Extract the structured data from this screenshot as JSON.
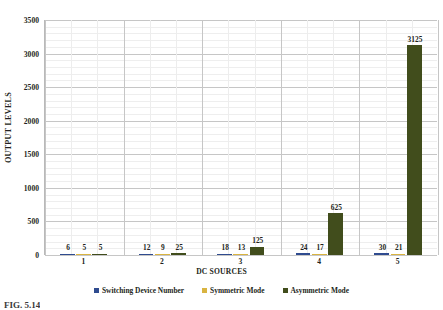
{
  "chart_data": {
    "type": "bar",
    "title": "",
    "xlabel": "DC SOURCES",
    "ylabel": "OUTPUT LEVELS",
    "categories": [
      "1",
      "2",
      "3",
      "4",
      "5"
    ],
    "ylim": [
      0,
      3500
    ],
    "ytick_step": 500,
    "yticks": [
      "0",
      "500",
      "1000",
      "1500",
      "2000",
      "2500",
      "3000",
      "3500"
    ],
    "grid": true,
    "legend_position": "bottom",
    "series": [
      {
        "name": "Switching Device Number",
        "color": "#2F4B8F",
        "values": [
          6,
          12,
          18,
          24,
          30
        ]
      },
      {
        "name": "Symmetric Mode",
        "color": "#D9B441",
        "values": [
          5,
          9,
          13,
          17,
          21
        ]
      },
      {
        "name": "Asymmetric Mode",
        "color": "#414D1C",
        "values": [
          5,
          25,
          125,
          625,
          3125
        ]
      }
    ]
  },
  "caption": {
    "text": "FIG. 5.14"
  }
}
